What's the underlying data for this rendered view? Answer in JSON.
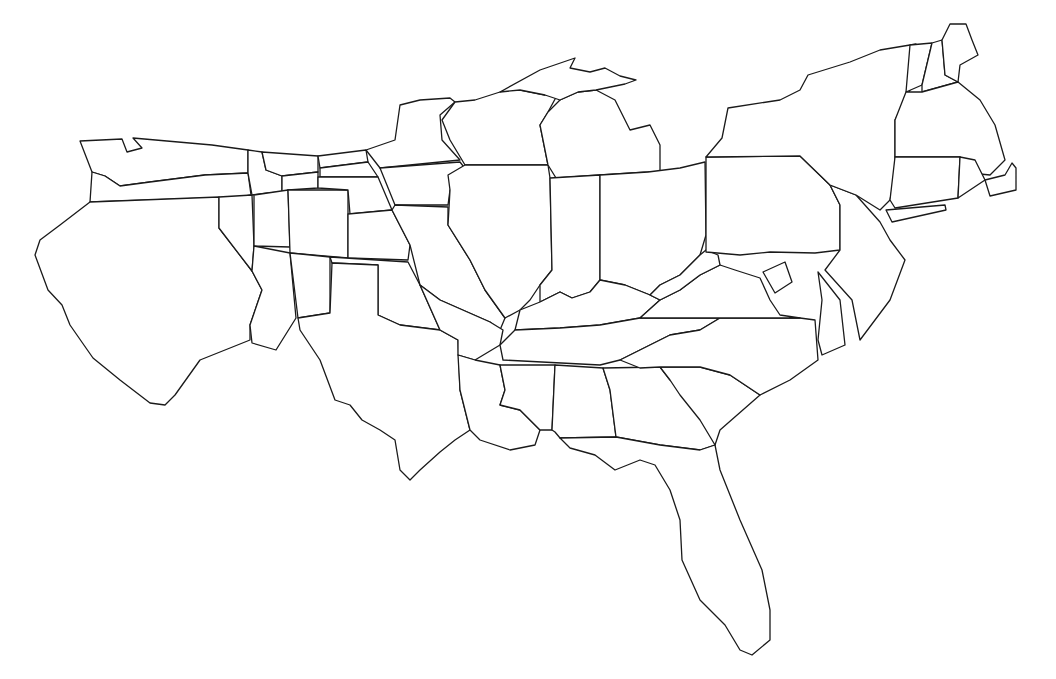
{
  "map": {
    "type": "outline-cartogram",
    "subject": "Contiguous United States state boundaries (distorted)",
    "stroke_color": "#1a1a1a",
    "fill_color": "#ffffff",
    "background": "#ffffff",
    "regions": [
      {
        "id": "washington",
        "d": "M80,141 L122,139 L127,152 L142,148 L133,138 L212,145 L248,150 L248,173 L205,175 L150,182 L120,186 L105,176 L92,172 Z"
      },
      {
        "id": "oregon",
        "d": "M92,172 L105,176 L120,186 L150,182 L205,175 L248,173 L251,195 L240,197 L90,202 Z"
      },
      {
        "id": "california",
        "d": "M90,202 L219,197 L219,228 L252,271 L262,290 L250,325 L250,340 L200,360 L175,395 L165,405 L150,403 L120,380 L93,358 L86,348 L70,325 L62,305 L48,290 L35,255 L40,240 L60,225 Z"
      },
      {
        "id": "nevada",
        "d": "M219,197 L252,195 L254,246 L252,271 L219,228 Z"
      },
      {
        "id": "idaho",
        "d": "M248,150 L262,152 L266,170 L282,176 L282,192 L268,193 L252,195 L248,173 Z"
      },
      {
        "id": "montana",
        "d": "M262,152 L318,156 L318,172 L282,176 L266,170 Z"
      },
      {
        "id": "wyoming",
        "d": "M282,176 L318,172 L318,188 L288,190 L282,192 Z"
      },
      {
        "id": "utah",
        "d": "M254,195 L288,190 L290,247 L254,246 Z"
      },
      {
        "id": "colorado",
        "d": "M288,190 L348,190 L348,258 L290,253 Z"
      },
      {
        "id": "arizona",
        "d": "M254,246 L290,253 L296,318 L276,350 L252,343 L250,325 L262,290 L252,271 Z"
      },
      {
        "id": "new-mexico",
        "d": "M290,253 L330,257 L330,313 L298,318 Z"
      },
      {
        "id": "north-dakota",
        "d": "M318,156 L366,150 L368,162 L320,168 Z"
      },
      {
        "id": "south-dakota",
        "d": "M320,168 L368,162 L378,177 L320,177 Z"
      },
      {
        "id": "nebraska",
        "d": "M318,177 L378,177 L392,210 L350,214 L348,190 L318,188 Z"
      },
      {
        "id": "kansas",
        "d": "M348,214 L392,210 L410,245 L408,260 L348,258 Z"
      },
      {
        "id": "oklahoma",
        "d": "M330,257 L408,262 L420,285 L440,330 L400,325 L378,315 L378,265 L332,263 Z"
      },
      {
        "id": "texas",
        "d": "M298,318 L330,313 L332,263 L378,265 L378,315 L400,325 L440,330 L458,340 L460,390 L470,430 L455,440 L440,452 L420,470 L410,480 L400,470 L395,440 L380,430 L362,420 L350,405 L335,400 L320,360 L300,330 Z"
      },
      {
        "id": "minnesota",
        "d": "M366,150 L395,140 L400,105 L420,100 L450,98 L455,102 L440,115 L442,140 L460,160 L380,168 Z"
      },
      {
        "id": "iowa",
        "d": "M380,168 L460,162 L470,175 L450,190 L448,205 L410,205 L395,205 Z"
      },
      {
        "id": "missouri",
        "d": "M395,205 L448,207 L448,225 L470,260 L485,290 L505,318 L500,330 L490,322 L440,300 L420,285 L410,245 L392,210 Z"
      },
      {
        "id": "arkansas",
        "d": "M420,285 L440,300 L490,322 L503,330 L500,345 L475,360 L458,355 L458,340 L440,330 Z"
      },
      {
        "id": "louisiana",
        "d": "M458,355 L475,360 L500,365 L505,390 L500,405 L520,410 L540,430 L535,445 L510,450 L480,440 L470,430 L460,390 Z"
      },
      {
        "id": "wisconsin",
        "d": "M455,102 L475,100 L500,92 L535,80 L520,90 L545,95 L560,90 L548,112 L540,125 L545,150 L548,165 L465,165 L450,140 L442,120 Z"
      },
      {
        "id": "illinois",
        "d": "M448,175 L465,165 L548,165 L550,178 L552,270 L540,285 L530,300 L520,310 L505,318 L485,290 L470,260 L448,225 L450,190 Z"
      },
      {
        "id": "michigan",
        "d": "M540,125 L548,112 L560,100 L578,92 L596,90 L615,100 L625,120 L630,130 L650,125 L660,145 L660,175 L648,172 L600,175 L556,178 L548,165 L545,150 Z"
      },
      {
        "id": "michigan-up",
        "d": "M500,92 L540,70 L575,58 L570,68 L590,72 L605,68 L620,76 L636,80 L625,84 L596,90 L578,92 L560,100 L545,95 L520,90 Z"
      },
      {
        "id": "indiana",
        "d": "M550,178 L600,175 L600,280 L590,292 L572,298 L560,292 L540,302 L540,285 L552,270 Z"
      },
      {
        "id": "ohio",
        "d": "M600,175 L648,172 L680,168 L705,162 L706,235 L700,255 L680,275 L660,285 L650,295 L625,285 L600,280 Z"
      },
      {
        "id": "kentucky",
        "d": "M520,310 L540,302 L560,292 L572,298 L590,292 L600,280 L625,285 L650,295 L660,300 L640,318 L600,325 L560,328 L515,330 Z"
      },
      {
        "id": "tennessee",
        "d": "M500,345 L515,330 L560,328 L600,325 L640,318 L720,318 L700,330 L670,335 L640,350 L620,360 L600,365 L503,360 Z"
      },
      {
        "id": "mississippi",
        "d": "M500,365 L555,365 L552,430 L540,430 L520,410 L500,405 L505,390 Z"
      },
      {
        "id": "alabama",
        "d": "M555,365 L603,368 L610,390 L616,437 L560,438 L555,432 L552,430 Z"
      },
      {
        "id": "georgia",
        "d": "M603,368 L660,367 L670,380 L700,400 L718,425 L715,445 L700,450 L660,445 L616,437 L610,390 Z"
      },
      {
        "id": "florida",
        "d": "M560,438 L616,437 L660,445 L700,450 L715,445 L720,470 L740,520 L762,570 L770,610 L770,640 L752,655 L740,650 L725,625 L700,600 L682,560 L680,520 L670,490 L655,465 L640,460 L615,470 L595,455 L570,448 Z"
      },
      {
        "id": "south-carolina",
        "d": "M660,367 L700,367 L730,375 L760,395 L720,430 L715,445 L700,420 L680,395 L670,380 Z"
      },
      {
        "id": "north-carolina",
        "d": "M620,360 L640,350 L670,335 L700,330 L720,318 L800,318 L815,320 L818,360 L790,380 L760,395 L730,375 L700,367 L660,367 L640,368 Z"
      },
      {
        "id": "virginia",
        "d": "M640,318 L660,300 L680,290 L700,275 L720,265 L735,270 L760,278 L770,300 L780,315 L800,318 L720,318 Z"
      },
      {
        "id": "west-virginia",
        "d": "M650,295 L660,285 L680,275 L700,255 L706,250 L718,255 L720,265 L700,275 L680,290 L660,300 Z"
      },
      {
        "id": "maryland-dc",
        "d": "M763,272 L785,262 L792,282 L775,293 Z"
      },
      {
        "id": "delmarva",
        "d": "M818,272 L840,300 L845,345 L822,355 L818,340 L822,300 Z"
      },
      {
        "id": "pennsylvania",
        "d": "M706,157 L800,156 L830,185 L840,205 L840,250 L815,253 L770,252 L740,255 L706,252 Z"
      },
      {
        "id": "new-jersey",
        "d": "M830,185 L856,195 L880,222 L890,240 L905,260 L890,300 L860,340 L852,300 L825,270 L840,250 L840,205 Z"
      },
      {
        "id": "new-york",
        "d": "M706,157 L722,138 L728,108 L780,100 L800,90 L808,75 L850,62 L880,50 L916,44 L910,90 L895,120 L895,175 L890,200 L880,210 L856,195 L830,185 L800,156 Z"
      },
      {
        "id": "long-island",
        "d": "M886,210 L945,205 L946,210 L892,222 Z"
      },
      {
        "id": "vermont",
        "d": "M910,45 L932,43 L922,85 L906,92 Z"
      },
      {
        "id": "new-hampshire",
        "d": "M932,43 L942,40 L945,75 L958,82 L922,92 L922,85 Z"
      },
      {
        "id": "maine",
        "d": "M942,40 L950,24 L966,24 L972,40 L978,55 L960,65 L958,82 L945,75 Z"
      },
      {
        "id": "massachusetts",
        "d": "M906,92 L922,92 L958,82 L980,100 L995,125 L1005,160 L990,175 L970,173 L960,157 L895,157 L895,120 Z"
      },
      {
        "id": "connecticut",
        "d": "M895,157 L960,157 L958,198 L895,208 L890,200 Z"
      },
      {
        "id": "rhode-island",
        "d": "M960,157 L975,160 L985,180 L958,198 Z"
      },
      {
        "id": "cape-cod",
        "d": "M985,180 L1005,175 L1012,163 L1016,168 L1016,190 L990,196 Z"
      }
    ]
  },
  "caption": {
    "text": "",
    "note": "caption clipped at bottom edge, not legible"
  }
}
